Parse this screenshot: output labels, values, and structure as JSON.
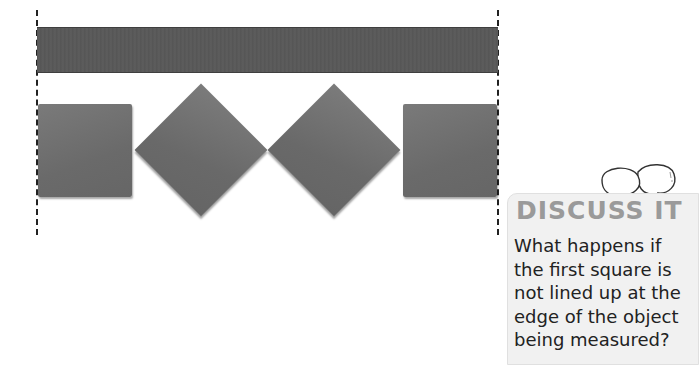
{
  "figure": {
    "object_label": "ribbon",
    "unit_shapes": [
      "square",
      "diamond",
      "diamond",
      "square"
    ],
    "colors": {
      "ribbon": "#575757",
      "unit_square": "#707070",
      "dashed_guide": "#222222",
      "discuss_panel_bg": "#f1f1f1",
      "discuss_title": "#9a9a9a"
    }
  },
  "discuss": {
    "title": "DISCUSS IT",
    "icon": "speech-bubbles-icon",
    "question_lines": [
      "What happens if",
      "the first square is",
      "not lined up at the",
      "edge of the object",
      "being measured?"
    ]
  }
}
